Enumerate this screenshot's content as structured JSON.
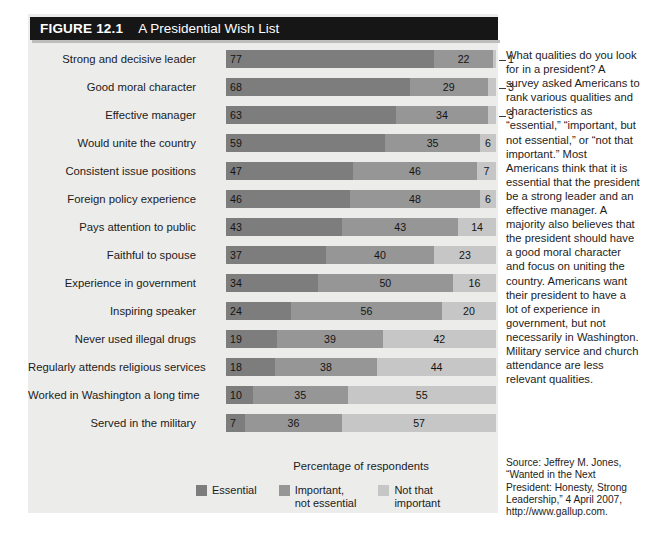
{
  "figure": {
    "number": "FIGURE 12.1",
    "title": "A Presidential Wish List"
  },
  "axis_caption": "Percentage of respondents",
  "legend": [
    {
      "label": "Essential",
      "color": "#7d7d7d"
    },
    {
      "label": "Important,\nnot essential",
      "color": "#969696"
    },
    {
      "label": "Not that\nimportant",
      "color": "#c6c6c6"
    }
  ],
  "side_text": "What qualities do you look for in a president? A survey asked Americans to rank various qualities and characteristics as “essential,” “important, but not essential,” or “not that important.” Most Americans think that it is essential that the president be a strong leader and an effective manager. A majority also believes that the president should have a good moral character and focus on uniting the country. Americans want their president to have a lot of experience in government, but not necessarily in Washington. Military service and church attendance are less relevant qualities.",
  "source_note": "Source: Jeffrey M. Jones, “Wanted in the Next President: Honesty, Strong Leadership,” 4 April 2007, http://www.gallup.com.",
  "chart_data": {
    "type": "bar",
    "orientation": "horizontal",
    "stacked": true,
    "title": "A Presidential Wish List",
    "xlabel": "Percentage of respondents",
    "ylabel": "",
    "xlim": [
      0,
      100
    ],
    "grid": false,
    "legend_position": "bottom",
    "categories": [
      "Strong and decisive leader",
      "Good moral character",
      "Effective manager",
      "Would unite the country",
      "Consistent issue positions",
      "Foreign policy experience",
      "Pays attention to public",
      "Faithful to spouse",
      "Experience in government",
      "Inspiring speaker",
      "Never used illegal drugs",
      "Regularly attends religious services",
      "Worked in Washington a long time",
      "Served in the military"
    ],
    "series": [
      {
        "name": "Essential",
        "color": "#7d7d7d",
        "values": [
          77,
          68,
          63,
          59,
          47,
          46,
          43,
          37,
          34,
          24,
          19,
          18,
          10,
          7
        ]
      },
      {
        "name": "Important, not essential",
        "color": "#969696",
        "values": [
          22,
          29,
          34,
          35,
          46,
          48,
          43,
          40,
          50,
          56,
          39,
          38,
          35,
          36
        ]
      },
      {
        "name": "Not that important",
        "color": "#c6c6c6",
        "values": [
          1,
          3,
          3,
          6,
          7,
          6,
          14,
          23,
          16,
          20,
          42,
          44,
          55,
          57
        ]
      }
    ],
    "callout_rows": [
      0,
      1,
      2
    ]
  }
}
